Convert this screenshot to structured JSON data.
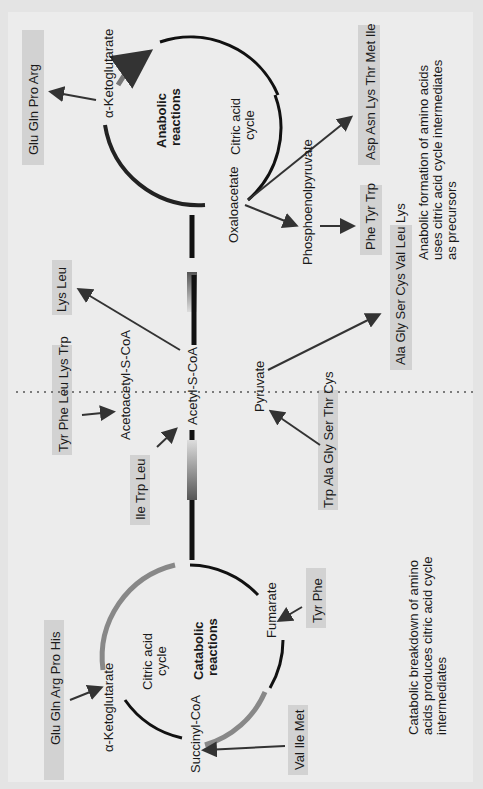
{
  "diagram": {
    "orientation": "rotated-90-ccw",
    "divider": "dotted-vertical-separator",
    "anabolic": {
      "cycle_title": "Anabolic reactions",
      "cycle_subtitle": "Citric acid cycle",
      "intermediates": {
        "alpha_ketoglutarate": "α-Ketoglutarate",
        "oxaloacetate": "Oxaloacetate",
        "phosphoenolpyruvate": "Phosphoenolpyruvate"
      },
      "products": {
        "from_akg": "Glu Gln Pro Arg",
        "from_oaa": "Asp Asn Lys Thr Met Ile",
        "from_pep": "Phe Tyr Trp",
        "from_pyruvate": "Ala Gly Ser Cys Val Leu Lys",
        "from_acetyl": "Lys Leu"
      },
      "caption": "Anabolic formation of amino acids uses citric acid cycle intermediates as precursors"
    },
    "central": {
      "acetyl": "Acetyl-S-CoA",
      "acetoacetyl": "Acetoacetyl-S-CoA",
      "pyruvate": "Pyruvate"
    },
    "catabolic": {
      "cycle_title": "Catabolic reactions",
      "cycle_subtitle": "Citric acid cycle",
      "intermediates": {
        "alpha_ketoglutarate": "α-Ketoglutarate",
        "succinyl": "Succinyl-CoA",
        "fumarate": "Fumarate"
      },
      "sources": {
        "to_akg": "Glu Gln Arg Pro His",
        "to_succinyl": "Val Ile Met",
        "to_fumarate": "Tyr Phe",
        "to_pyruvate": "Trp Ala Gly Ser Thr Cys",
        "to_acetoacetyl": "Tyr Phe Leu Lys Trp",
        "to_acetyl": "Ile Trp Leu"
      },
      "caption": "Catabolic breakdown of amino acids produces citric acid cycle intermediates"
    }
  }
}
